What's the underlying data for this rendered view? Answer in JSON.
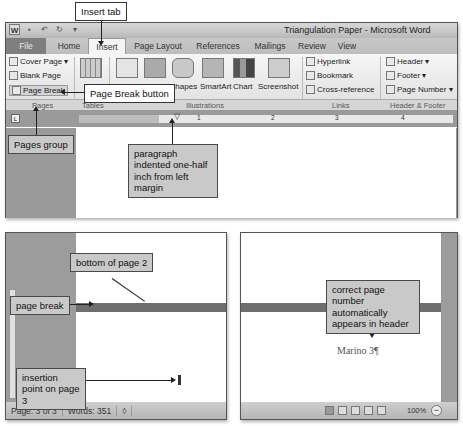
{
  "window": {
    "title": "Triangulation Paper - Microsoft Word",
    "quick_access": [
      "word-logo",
      "save-icon",
      "undo-icon",
      "redo-icon",
      "customize-icon"
    ]
  },
  "tabs": [
    {
      "label": "File"
    },
    {
      "label": "Home"
    },
    {
      "label": "Insert",
      "active": true
    },
    {
      "label": "Page Layout"
    },
    {
      "label": "References"
    },
    {
      "label": "Mailings"
    },
    {
      "label": "Review"
    },
    {
      "label": "View"
    }
  ],
  "ribbon": {
    "pages": {
      "label": "Pages",
      "items": [
        "Cover Page ▾",
        "Blank Page",
        "Page Break"
      ]
    },
    "tables": {
      "label": "Tables",
      "items": [
        "Table"
      ]
    },
    "illustrations": {
      "label": "Illustrations",
      "items": [
        "Picture",
        "Clip Art",
        "Shapes",
        "SmartArt",
        "Chart",
        "Screenshot"
      ]
    },
    "links": {
      "label": "Links",
      "items": [
        "Hyperlink",
        "Bookmark",
        "Cross-reference"
      ]
    },
    "header_footer": {
      "label": "Header & Footer",
      "items": [
        "Header ▾",
        "Footer ▾",
        "Page Number ▾"
      ]
    }
  },
  "ruler": {
    "numbers": [
      "1",
      "2",
      "3",
      "4"
    ]
  },
  "callouts": {
    "insert_tab": "Insert tab",
    "page_break_button": "Page Break button",
    "pages_group": "Pages group",
    "paragraph_indent": "paragraph indented one-half inch from left margin",
    "bottom_of_page2": "bottom of page 2",
    "page_break": "page break",
    "insertion_point": "insertion point on page 3",
    "page_number": "correct page number automatically appears in header"
  },
  "document": {
    "header_text": "Marino 3¶"
  },
  "status_bar": {
    "page": "Page: 3 of 3",
    "words": "Words: 351",
    "zoom": "100%"
  }
}
